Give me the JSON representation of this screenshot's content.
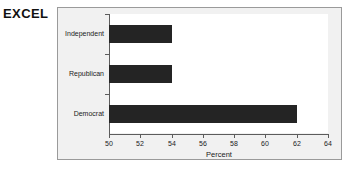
{
  "caption": {
    "text": "EXCEL"
  },
  "chart_data": {
    "type": "bar",
    "orientation": "horizontal",
    "title": "",
    "subtitle": "",
    "xlabel": "Percent",
    "ylabel": "",
    "categories": [
      "Independent",
      "Republican",
      "Democrat"
    ],
    "values": [
      54,
      54,
      62
    ],
    "series": [
      {
        "name": "Percent",
        "values": [
          54,
          54,
          62
        ]
      }
    ],
    "xlim": [
      50,
      64
    ],
    "xticks": [
      50,
      52,
      54,
      56,
      58,
      60,
      62,
      64
    ],
    "xtick_labels": [
      "50",
      "52",
      "54",
      "56",
      "58",
      "60",
      "62",
      "64"
    ],
    "grid": false,
    "legend": false,
    "legend_position": "none",
    "bar_color": "#242424",
    "plot_background": "#ffffff",
    "frame_background": "#f1f1f1",
    "frame_border_color": "#9a9a9a",
    "axis_color": "#5c5c5c"
  }
}
